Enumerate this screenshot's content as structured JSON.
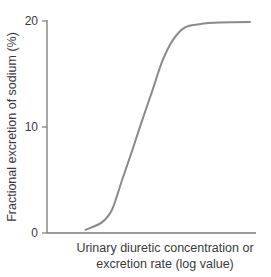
{
  "chart_data": {
    "type": "line",
    "title": "",
    "xlabel": "Urinary diuretic concentration or excretion rate (log value)",
    "xlabel_lines": [
      "Urinary diuretic concentration or",
      "excretion rate (log value)"
    ],
    "ylabel": "Fractional excretion of sodium (%)",
    "ylim": [
      0,
      20
    ],
    "yticks": [
      0,
      10,
      20
    ],
    "xticks": [],
    "grid": false,
    "legend": null,
    "series": [
      {
        "name": "Dose-response curve",
        "color": "#8a8a8a",
        "x": [
          0.19,
          0.27,
          0.32,
          0.37,
          0.42,
          0.47,
          0.52,
          0.57,
          0.62,
          0.68,
          0.75,
          0.85,
          1.0
        ],
        "y": [
          0.3,
          1.0,
          2.2,
          5.0,
          7.8,
          10.7,
          13.5,
          16.3,
          18.2,
          19.4,
          19.7,
          19.85,
          19.9
        ]
      }
    ]
  },
  "axes": {
    "y_tick_labels": [
      "20",
      "10",
      "0"
    ]
  }
}
